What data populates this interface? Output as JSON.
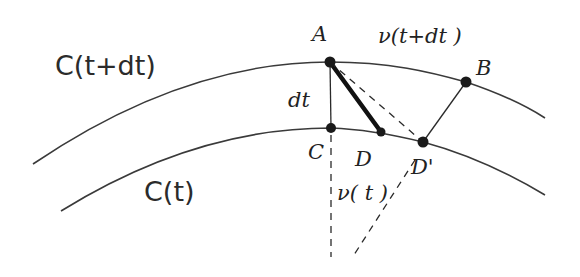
{
  "diagram": {
    "curves": [
      {
        "label": "C(t+dt)"
      },
      {
        "label": "C(t)"
      }
    ],
    "points": {
      "A": "A",
      "B": "B",
      "C": "C",
      "D": "D",
      "D_prime": "D'"
    },
    "segment_labels": {
      "dt": "dt",
      "v_t_plus_dt": "ν(t+dt )",
      "v_t": "ν( t )"
    },
    "colors": {
      "ink": "#1a1a1a",
      "background": "#ffffff"
    }
  }
}
